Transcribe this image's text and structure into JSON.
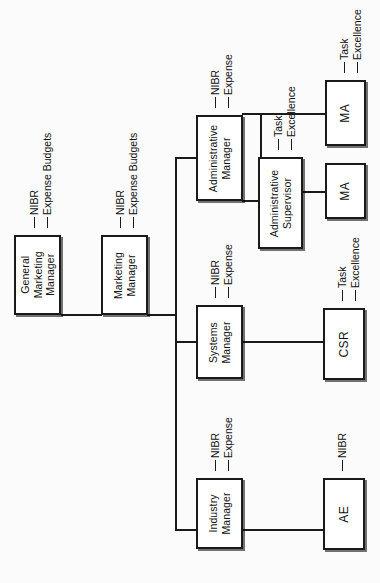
{
  "diagram": {
    "type": "org-chart",
    "orientation": "rotated-90-left",
    "colors": {
      "line": "#1a1a1a",
      "box_border": "#1a1a1a",
      "box_fill": "#ffffff",
      "background": "#fbfbfb",
      "text": "#121212"
    }
  },
  "nodes": {
    "general_marketing_manager": {
      "label": "General\nMarketing\nManager",
      "line1": "General",
      "line2": "Marketing",
      "line3": "Manager"
    },
    "marketing_manager": {
      "label": "Marketing\nManager",
      "line1": "Marketing",
      "line2": "Manager"
    },
    "administrative_manager": {
      "label": "Administrative\nManager",
      "line1": "Administrative",
      "line2": "Manager"
    },
    "systems_manager": {
      "label": "Systems\nManager",
      "line1": "Systems",
      "line2": "Manager"
    },
    "industry_manager": {
      "label": "Industry\nManager",
      "line1": "Industry",
      "line2": "Manager"
    },
    "administrative_supervisor": {
      "label": "Administrative\nSupervisor",
      "line1": "Administrative",
      "line2": "Supervisor"
    },
    "ma_top": {
      "label": "MA"
    },
    "ma_second": {
      "label": "MA"
    },
    "csr": {
      "label": "CSR"
    },
    "ae": {
      "label": "AE"
    }
  },
  "annotations": {
    "gmm": {
      "row1": "NIBR",
      "row2": "Expense Budgets"
    },
    "mm": {
      "row1": "NIBR",
      "row2": "Expense Budgets"
    },
    "admin_mgr": {
      "row1": "NIBR",
      "row2": "Expense"
    },
    "systems_mgr": {
      "row1": "NIBR",
      "row2": "Expense"
    },
    "industry_mgr": {
      "row1": "NIBR",
      "row2": "Expense"
    },
    "ma_top": {
      "row1": "Task",
      "row2": "Excellence"
    },
    "admin_sup": {
      "row1": "Task",
      "row2": "Excellence"
    },
    "csr": {
      "row1": "Task",
      "row2": "Excellence"
    },
    "ae": {
      "row1": "NIBR"
    }
  }
}
